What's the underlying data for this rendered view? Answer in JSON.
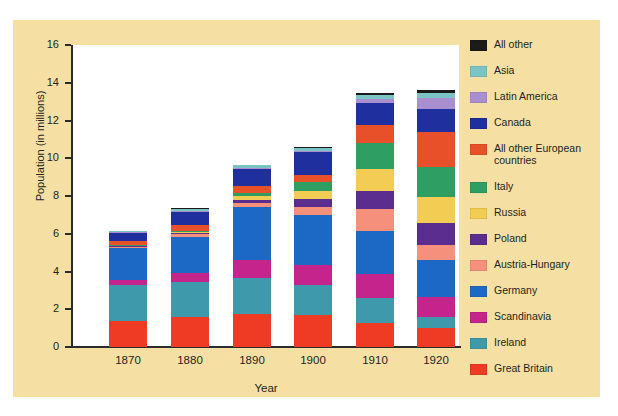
{
  "figure": {
    "panel_background": "#f5dfa3",
    "plot_background": "#ffffff"
  },
  "axes": {
    "y_title": "Population (in millions)",
    "x_title": "Year",
    "y_ticks": [
      "0",
      "2",
      "4",
      "6",
      "8",
      "10",
      "12",
      "14",
      "16"
    ],
    "x_ticks": [
      "1870",
      "1880",
      "1890",
      "1900",
      "1910",
      "1920"
    ]
  },
  "legend": {
    "items": [
      {
        "label": "All other",
        "color": "#1a1a1a"
      },
      {
        "label": "Asia",
        "color": "#7bc4c4"
      },
      {
        "label": "Latin America",
        "color": "#a98fd0"
      },
      {
        "label": "Canada",
        "color": "#1f2f9e"
      },
      {
        "label": "All other European\ncountries",
        "color": "#e8502a"
      },
      {
        "label": "Italy",
        "color": "#2e9e62"
      },
      {
        "label": "Russia",
        "color": "#f3cc54"
      },
      {
        "label": "Poland",
        "color": "#5b2d8e"
      },
      {
        "label": "Austria-Hungary",
        "color": "#f4907c"
      },
      {
        "label": "Germany",
        "color": "#1b69c4"
      },
      {
        "label": "Scandinavia",
        "color": "#c4248c"
      },
      {
        "label": "Ireland",
        "color": "#3e9aaa"
      },
      {
        "label": "Great Britain",
        "color": "#ef3b24"
      }
    ]
  },
  "chart_data": {
    "type": "bar",
    "title": "",
    "subtitle": "",
    "stacked": true,
    "xlabel": "Year",
    "ylabel": "Population (in millions)",
    "ylim": [
      0,
      16
    ],
    "ytick_step": 2,
    "grid": false,
    "legend_position": "right",
    "categories": [
      "1870",
      "1880",
      "1890",
      "1900",
      "1910",
      "1920"
    ],
    "series": [
      {
        "name": "Great Britain",
        "color": "#ef3b24",
        "values": [
          1.4,
          1.6,
          1.75,
          1.7,
          1.25,
          1.0
        ]
      },
      {
        "name": "Ireland",
        "color": "#3e9aaa",
        "values": [
          1.9,
          1.85,
          1.9,
          1.6,
          1.35,
          0.6
        ]
      },
      {
        "name": "Scandinavia",
        "color": "#c4248c",
        "values": [
          0.25,
          0.45,
          0.95,
          1.05,
          1.25,
          1.05
        ]
      },
      {
        "name": "Germany",
        "color": "#1b69c4",
        "values": [
          1.7,
          1.95,
          2.8,
          2.65,
          2.3,
          1.95
        ]
      },
      {
        "name": "Austria-Hungary",
        "color": "#f4907c",
        "values": [
          0.05,
          0.12,
          0.25,
          0.43,
          1.15,
          0.8
        ]
      },
      {
        "name": "Poland",
        "color": "#5b2d8e",
        "values": [
          0.05,
          0.1,
          0.15,
          0.4,
          0.95,
          1.15
        ]
      },
      {
        "name": "Russia",
        "color": "#f3cc54",
        "values": [
          0.01,
          0.04,
          0.18,
          0.43,
          1.2,
          1.4
        ]
      },
      {
        "name": "Italy",
        "color": "#2e9e62",
        "values": [
          0.02,
          0.05,
          0.18,
          0.48,
          1.35,
          1.6
        ]
      },
      {
        "name": "All other European countries",
        "color": "#e8502a",
        "values": [
          0.22,
          0.3,
          0.35,
          0.4,
          0.95,
          1.85
        ]
      },
      {
        "name": "Canada",
        "color": "#1f2f9e",
        "values": [
          0.45,
          0.72,
          0.95,
          1.2,
          1.2,
          1.2
        ]
      },
      {
        "name": "Latin America",
        "color": "#a98fd0",
        "values": [
          0.02,
          0.03,
          0.05,
          0.07,
          0.22,
          0.62
        ]
      },
      {
        "name": "Asia",
        "color": "#7bc4c4",
        "values": [
          0.06,
          0.12,
          0.12,
          0.12,
          0.2,
          0.22
        ]
      },
      {
        "name": "All other",
        "color": "#1a1a1a",
        "values": [
          0.03,
          0.03,
          0.04,
          0.05,
          0.08,
          0.16
        ]
      }
    ],
    "totals": [
      6.0,
      7.0,
      9.2,
      10.4,
      13.45,
      14.6
    ]
  }
}
